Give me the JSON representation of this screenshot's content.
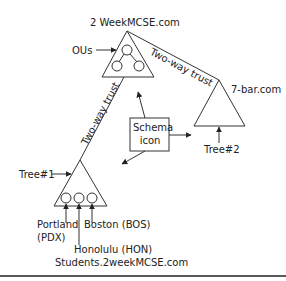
{
  "diagram": {
    "root_domain": "2 WeekMCSE.com",
    "ous_label": "OUs",
    "trust_top": "Two-way trust",
    "trust_left": "Two-way trust",
    "second_domain": "7-bar.com",
    "schema_box_line1": "Schema",
    "schema_box_line2": "icon",
    "tree1_label": "Tree#1",
    "tree2_label": "Tree#2",
    "site1": "Portland",
    "site1_code": "(PDX)",
    "site2": "Honolulu (HON)",
    "site3": "Boston (BOS)",
    "child_domain": "Students.2weekMCSE.com"
  }
}
